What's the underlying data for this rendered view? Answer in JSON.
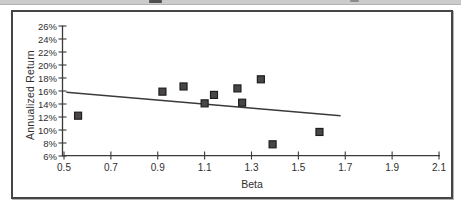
{
  "colors": {
    "axis": "#3a3a3a",
    "text": "#2f2f2f",
    "trend": "#3a3a3a",
    "point_fill": "#4a4547",
    "point_stroke": "#1e1e1e",
    "frame_border": "#454545",
    "top_strip": "#cbcbcb"
  },
  "chart_data": {
    "type": "scatter",
    "title": "",
    "xlabel": "Beta",
    "ylabel": "Annualized Return",
    "xlim": [
      0.5,
      2.1
    ],
    "ylim": [
      6,
      26
    ],
    "grid": false,
    "legend": "none",
    "x_ticks": [
      0.5,
      0.7,
      0.9,
      1.1,
      1.3,
      1.5,
      1.7,
      1.9,
      2.1
    ],
    "x_tick_labels": [
      "0.5",
      "0.7",
      "0.9",
      "1.1",
      "1.3",
      "1.5",
      "1.7",
      "1.9",
      "2.1"
    ],
    "y_ticks": [
      6,
      8,
      10,
      12,
      14,
      16,
      18,
      20,
      22,
      24,
      26
    ],
    "y_tick_labels": [
      "6%",
      "8%",
      "10%",
      "12%",
      "14%",
      "16%",
      "18%",
      "20%",
      "22%",
      "24%",
      "26%"
    ],
    "points": [
      {
        "beta": 0.56,
        "return_pct": 12.2
      },
      {
        "beta": 0.92,
        "return_pct": 15.9
      },
      {
        "beta": 1.01,
        "return_pct": 16.7
      },
      {
        "beta": 1.1,
        "return_pct": 14.1
      },
      {
        "beta": 1.14,
        "return_pct": 15.4
      },
      {
        "beta": 1.24,
        "return_pct": 16.4
      },
      {
        "beta": 1.26,
        "return_pct": 14.2
      },
      {
        "beta": 1.34,
        "return_pct": 17.8
      },
      {
        "beta": 1.39,
        "return_pct": 7.8
      },
      {
        "beta": 1.59,
        "return_pct": 9.7
      }
    ],
    "trend_line": {
      "x1": 0.51,
      "y1": 15.8,
      "x2": 1.68,
      "y2": 12.2
    }
  }
}
